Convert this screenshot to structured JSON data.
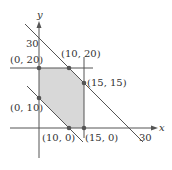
{
  "diagram": {
    "type": "linear-programming-feasible-region",
    "axes": {
      "x_label": "x",
      "y_label": "y",
      "x_tick_label": "30",
      "y_tick_label": "30"
    },
    "lines": [
      {
        "name": "x + y = 30"
      },
      {
        "name": "x + y = 10"
      },
      {
        "name": "y = 20"
      },
      {
        "name": "x = 15"
      }
    ],
    "vertices": [
      {
        "label": "(0, 20)",
        "x": 0,
        "y": 20
      },
      {
        "label": "(10, 20)",
        "x": 10,
        "y": 20
      },
      {
        "label": "(15, 15)",
        "x": 15,
        "y": 15
      },
      {
        "label": "(0, 10)",
        "x": 0,
        "y": 10
      },
      {
        "label": "(10, 0)",
        "x": 10,
        "y": 0
      },
      {
        "label": "(15, 0)",
        "x": 15,
        "y": 0
      }
    ],
    "colors": {
      "region_fill": "#d8d8d8",
      "line": "#555555",
      "point": "#555555"
    }
  }
}
